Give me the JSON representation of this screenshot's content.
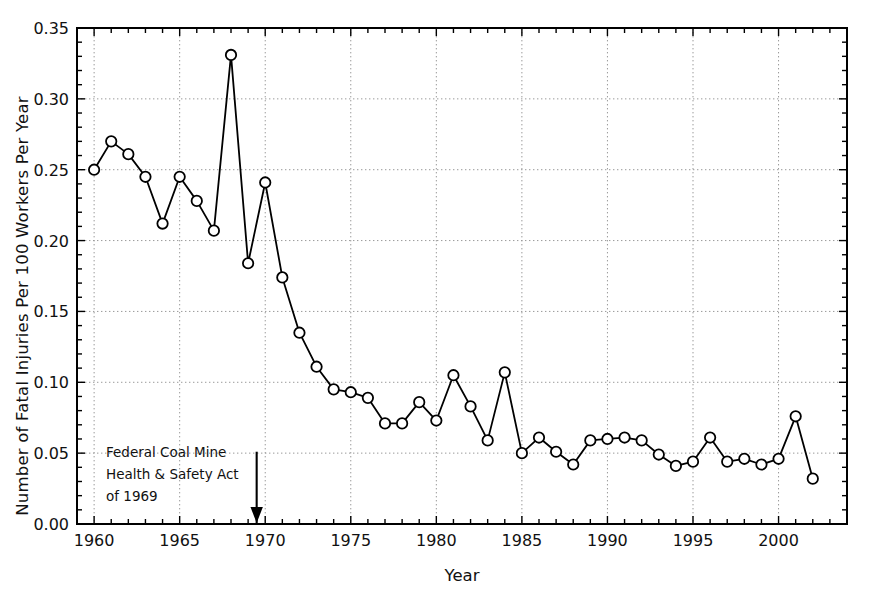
{
  "chart_data": {
    "type": "line",
    "title": "",
    "xlabel": "Year",
    "ylabel": "Number of Fatal Injuries Per 100 Workers Per Year",
    "xlim": [
      1959,
      2004
    ],
    "ylim": [
      0.0,
      0.35
    ],
    "grid": true,
    "legend": "none",
    "marker": "open-circle",
    "x_ticks": [
      "1960",
      "1965",
      "1970",
      "1975",
      "1980",
      "1985",
      "1990",
      "1995",
      "2000"
    ],
    "x_tick_values": [
      1960,
      1965,
      1970,
      1975,
      1980,
      1985,
      1990,
      1995,
      2000
    ],
    "y_ticks": [
      "0.00",
      "0.05",
      "0.10",
      "0.15",
      "0.20",
      "0.25",
      "0.30",
      "0.35"
    ],
    "y_tick_values": [
      0.0,
      0.05,
      0.1,
      0.15,
      0.2,
      0.25,
      0.3,
      0.35
    ],
    "x": [
      1960,
      1961,
      1962,
      1963,
      1964,
      1965,
      1966,
      1967,
      1968,
      1969,
      1970,
      1971,
      1972,
      1973,
      1974,
      1975,
      1976,
      1977,
      1978,
      1979,
      1980,
      1981,
      1982,
      1983,
      1984,
      1985,
      1986,
      1987,
      1988,
      1989,
      1990,
      1991,
      1992,
      1993,
      1994,
      1995,
      1996,
      1997,
      1998,
      1999,
      2000,
      2001,
      2002
    ],
    "values": [
      0.25,
      0.27,
      0.261,
      0.245,
      0.212,
      0.245,
      0.228,
      0.207,
      0.331,
      0.184,
      0.241,
      0.174,
      0.135,
      0.111,
      0.095,
      0.093,
      0.089,
      0.071,
      0.071,
      0.086,
      0.073,
      0.105,
      0.083,
      0.059,
      0.107,
      0.05,
      0.061,
      0.051,
      0.042,
      0.059,
      0.06,
      0.061,
      0.059,
      0.049,
      0.041,
      0.044,
      0.061,
      0.044,
      0.046,
      0.042,
      0.046,
      0.076,
      0.032
    ],
    "annotations": [
      {
        "text": "Federal Coal Mine\nHealth & Safety Act\nof 1969",
        "arrow_x": 1969.5,
        "arrow_y_top": 0.051,
        "arrow_y_bottom": 0.0
      }
    ],
    "colors": {
      "line": "#000000",
      "marker_fill": "#ffffff",
      "marker_edge": "#000000",
      "grid": "#999999",
      "axis": "#000000"
    }
  },
  "axis": {
    "y_title": "Number of Fatal Injuries Per 100 Workers Per Year",
    "x_title": "Year"
  },
  "annotation": {
    "line1": "Federal Coal Mine",
    "line2": "Health & Safety Act",
    "line3": "of 1969"
  }
}
